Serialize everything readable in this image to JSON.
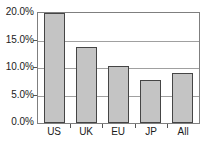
{
  "chart_data": {
    "type": "bar",
    "categories": [
      "US",
      "UK",
      "EU",
      "JP",
      "All"
    ],
    "values": [
      20.0,
      13.9,
      10.4,
      7.8,
      9.1
    ],
    "title": "",
    "xlabel": "",
    "ylabel": "",
    "ylim": [
      0,
      20
    ],
    "ytick_interval": 5,
    "yticklabels": [
      "0.0%",
      "5.0%",
      "10.0%",
      "15.0%",
      "20.0%"
    ],
    "grid": true,
    "legend": false
  },
  "colors": {
    "background": "#ffffff",
    "bar_fill": "#c4c4c4",
    "bar_border": "#454545",
    "grid_line": "#a0a0a0",
    "plot_border": "#7f7f7f",
    "tick": "#555555",
    "text": "#1b1b1b"
  }
}
